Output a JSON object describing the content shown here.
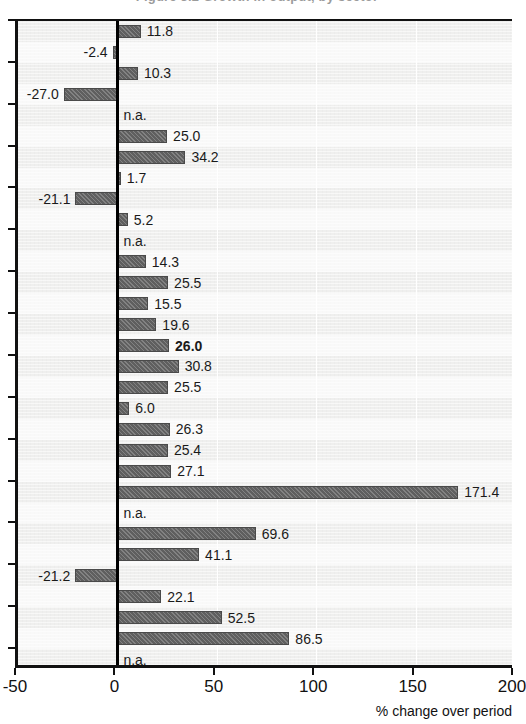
{
  "title_remnant": "Figure 3.2  Growth in output, by sector",
  "chart_data": {
    "type": "bar",
    "orientation": "horizontal",
    "title": "",
    "xlabel": "% change over period",
    "ylabel": "",
    "xlim": [
      -50,
      200
    ],
    "xticks": [
      -50,
      0,
      50,
      100,
      150,
      200
    ],
    "xticklabels": [
      "-50",
      "0",
      "50",
      "100",
      "150",
      "200"
    ],
    "grid": "vertical",
    "legend": "none",
    "zero_line": true,
    "na_text": "n.a.",
    "categories": [
      "row-01",
      "row-02",
      "row-03",
      "row-04",
      "row-05",
      "row-06",
      "row-07",
      "row-08",
      "row-09",
      "row-10",
      "row-11",
      "row-12",
      "row-13",
      "row-14",
      "row-15",
      "row-16",
      "row-17",
      "row-18",
      "row-19",
      "row-20",
      "row-21",
      "row-22",
      "row-23",
      "row-24",
      "row-25",
      "row-26",
      "row-27",
      "row-28",
      "row-29",
      "row-30",
      "row-31"
    ],
    "values": [
      11.8,
      -2.4,
      10.3,
      -27.0,
      null,
      25.0,
      34.2,
      1.7,
      -21.1,
      5.2,
      null,
      14.3,
      25.5,
      15.5,
      19.6,
      26.0,
      30.8,
      25.5,
      6.0,
      26.3,
      25.4,
      27.1,
      171.4,
      null,
      69.6,
      41.1,
      -21.2,
      22.1,
      52.5,
      86.5,
      null
    ],
    "labels": [
      "11.8",
      "-2.4",
      "10.3",
      "-27.0",
      "n.a.",
      "25.0",
      "34.2",
      "1.7",
      "-21.1",
      "5.2",
      "n.a.",
      "14.3",
      "25.5",
      "15.5",
      "19.6",
      "26.0",
      "30.8",
      "25.5",
      "6.0",
      "26.3",
      "25.4",
      "27.1",
      "171.4",
      "n.a.",
      "69.6",
      "41.1",
      "-21.2",
      "22.1",
      "52.5",
      "86.5",
      "n.a."
    ],
    "emphasized_index": 15,
    "bar_color": "#5f5f5f",
    "plot_background": "#efefee",
    "axis_color": "#111111"
  }
}
